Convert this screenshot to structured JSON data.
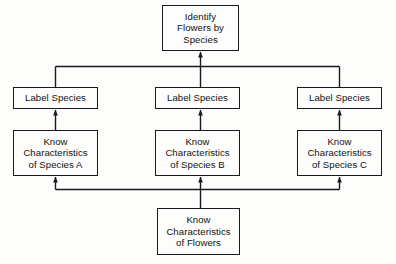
{
  "diagram": {
    "colors": {
      "background": "#fdfdfc",
      "line": "#1a1a1a",
      "text": "#111111",
      "box_fill": "#fdfdfc"
    },
    "nodes": {
      "goal": "Identify\nFlowers by\nSpecies",
      "label_a": "Label Species",
      "label_b": "Label Species",
      "label_c": "Label Species",
      "know_a": "Know\nCharacteristics\nof Species A",
      "know_b": "Know\nCharacteristics\nof Species B",
      "know_c": "Know\nCharacteristics\nof Species C",
      "base": "Know\nCharacteristics\nof Flowers"
    },
    "edges": [
      {
        "from": "label_a",
        "to": "goal",
        "style": "bus-up",
        "arrow": true
      },
      {
        "from": "label_b",
        "to": "goal",
        "style": "bus-up",
        "arrow": true
      },
      {
        "from": "label_c",
        "to": "goal",
        "style": "bus-up",
        "arrow": true
      },
      {
        "from": "know_a",
        "to": "label_a",
        "style": "straight-up",
        "arrow": true
      },
      {
        "from": "know_b",
        "to": "label_b",
        "style": "straight-up",
        "arrow": true
      },
      {
        "from": "know_c",
        "to": "label_c",
        "style": "straight-up",
        "arrow": true
      },
      {
        "from": "base",
        "to": "know_a",
        "style": "bus-up",
        "arrow": true
      },
      {
        "from": "base",
        "to": "know_b",
        "style": "straight-up",
        "arrow": true
      },
      {
        "from": "base",
        "to": "know_c",
        "style": "bus-up",
        "arrow": true
      }
    ]
  }
}
